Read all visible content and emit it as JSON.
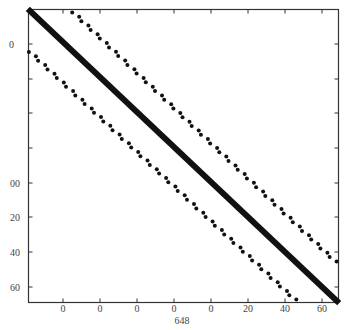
{
  "chart_data": {
    "type": "scatter",
    "subtype": "sparsity-pattern (spy plot)",
    "title": "",
    "xlabel": "648",
    "ylabel": "",
    "x_tick_labels": [
      "0",
      "0",
      "0",
      "0",
      "0",
      "20",
      "40",
      "60"
    ],
    "y_tick_labels": [
      "0",
      "",
      "",
      "",
      "00",
      "20",
      "40",
      "60"
    ],
    "grid": false,
    "legend": null,
    "series": [
      {
        "name": "main-diagonal",
        "style": "thick-line",
        "from": [
          0,
          0
        ],
        "to": [
          1,
          1
        ]
      },
      {
        "name": "upper-off-diagonal",
        "style": "dots",
        "from": [
          0.145,
          0.01
        ],
        "to": [
          0.99,
          0.86
        ],
        "count": 58
      },
      {
        "name": "lower-off-diagonal",
        "style": "dots",
        "from": [
          0.005,
          0.145
        ],
        "to": [
          0.86,
          0.99
        ],
        "count": 58
      }
    ],
    "colors": {
      "marks": "#111111",
      "axis": "#333333",
      "background": "#ffffff"
    }
  }
}
